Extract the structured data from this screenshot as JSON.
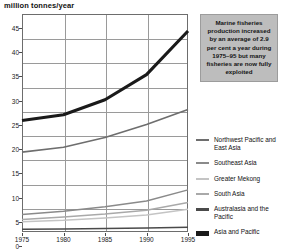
{
  "chart_data": {
    "type": "line",
    "title": "million tonnes/year",
    "xlabel": "",
    "ylabel": "million tonnes/year",
    "xlim": [
      1975,
      1995
    ],
    "ylim": [
      0,
      45
    ],
    "grid": true,
    "legend_position": "right",
    "x": [
      1975,
      1980,
      1985,
      1990,
      1995
    ],
    "yticks": [
      0,
      5,
      10,
      15,
      20,
      25,
      30,
      35,
      40,
      45
    ],
    "xticks": [
      "1975",
      "1980",
      "1985",
      "1990",
      "1995"
    ],
    "series": [
      {
        "name": "Asia and Pacific",
        "color": "#1a1a1a",
        "width": 3.1,
        "values": [
          23.0,
          24.2,
          27.3,
          32.5,
          41.5
        ]
      },
      {
        "name": "Northwest Pacific and East Asia",
        "color": "#6e6e6e",
        "width": 1.7,
        "values": [
          16.5,
          17.5,
          19.5,
          22.2,
          25.3
        ]
      },
      {
        "name": "Southeast Asia",
        "color": "#8a8a8a",
        "width": 1.5,
        "values": [
          3.6,
          4.3,
          5.2,
          6.4,
          8.7
        ]
      },
      {
        "name": "South Asia",
        "color": "#a9a9a9",
        "width": 1.5,
        "values": [
          2.6,
          3.1,
          3.7,
          4.5,
          6.1
        ]
      },
      {
        "name": "Greater Mekong",
        "color": "#c4c4c4",
        "width": 1.5,
        "values": [
          2.1,
          2.4,
          2.9,
          3.5,
          4.7
        ]
      },
      {
        "name": "Australasia and the Pacific",
        "color": "#4a4a4a",
        "width": 1.5,
        "values": [
          0.55,
          0.6,
          0.7,
          0.8,
          1.0
        ]
      }
    ]
  },
  "callout": {
    "text": "Marine fisheries production increased by an average of 2.9 per cent a year during 1975–95 but many fisheries are now fully exploited",
    "background": "#bdbdbd"
  },
  "legend": {
    "items": [
      {
        "label": "Northwest Pacific and East Asia",
        "color": "#6e6e6e",
        "thickness": 2
      },
      {
        "label": "Southeast Asia",
        "color": "#8a8a8a",
        "thickness": 2
      },
      {
        "label": "Greater Mekong",
        "color": "#c4c4c4",
        "thickness": 2
      },
      {
        "label": "South Asia",
        "color": "#a9a9a9",
        "thickness": 2
      },
      {
        "label": "Australasia and the Pacific",
        "color": "#4a4a4a",
        "thickness": 3
      },
      {
        "label": "Asia and Pacific",
        "color": "#1a1a1a",
        "thickness": 5
      }
    ]
  }
}
